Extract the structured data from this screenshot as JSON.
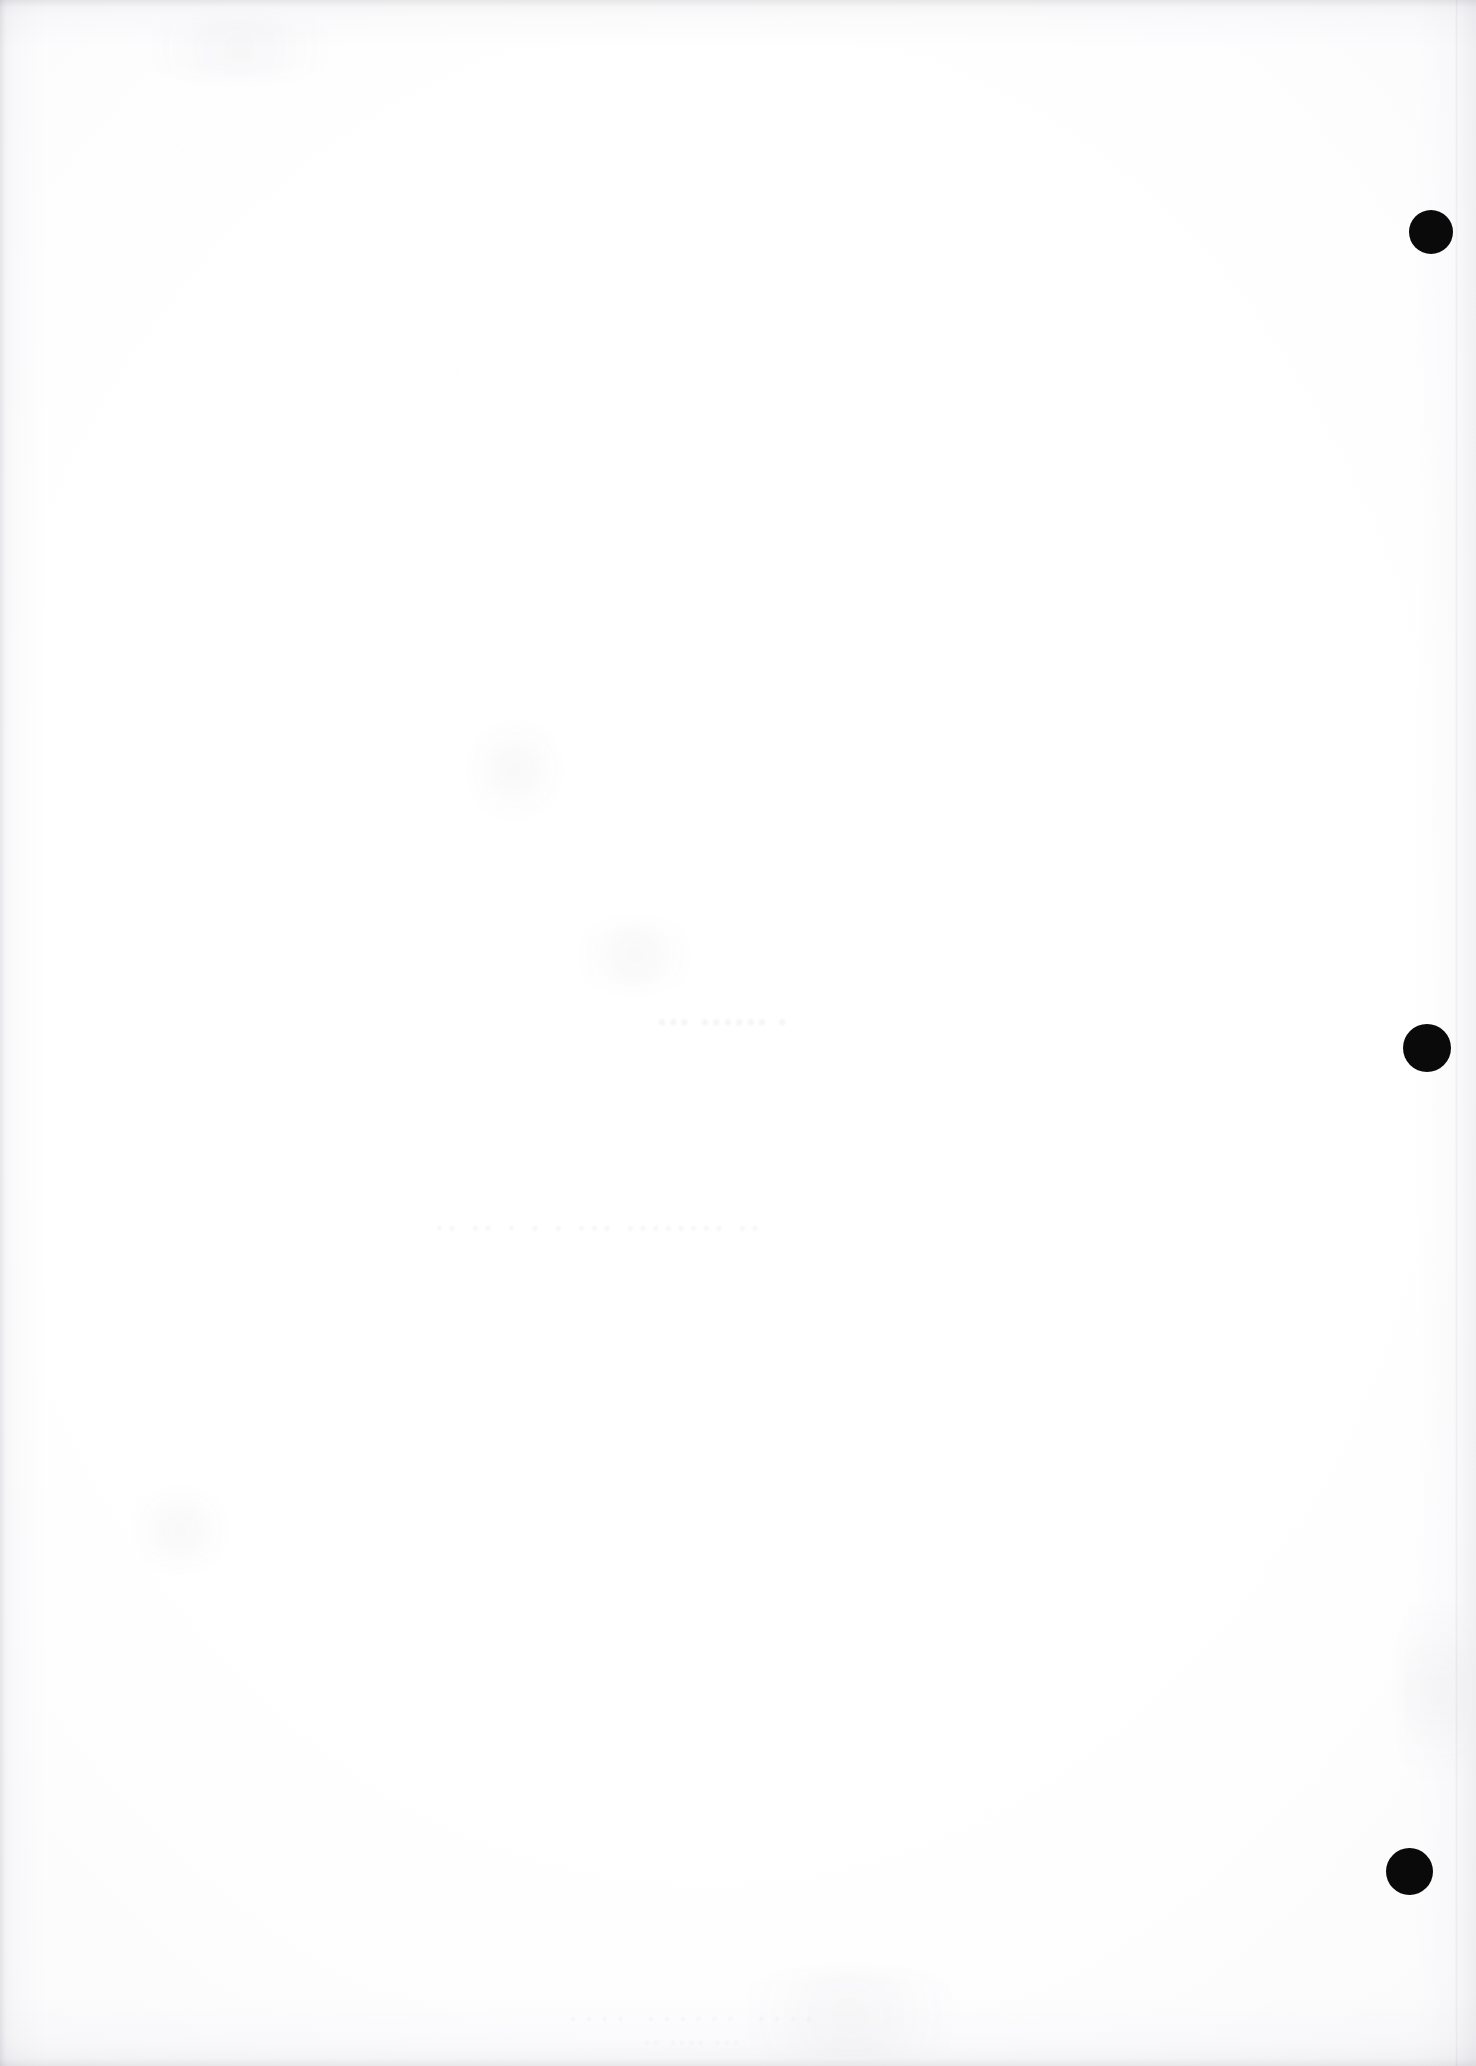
{
  "page": {
    "width": 1476,
    "height": 2066,
    "background_color": "#ffffff",
    "paper_tone": "#fbfbfc",
    "edge_shadow_color": "#f2f2f4",
    "content_summary": "Blank scanned book page with three solid black circular registration marks down the right margin and faint show-through from the reverse side.",
    "visible_text": ""
  },
  "marks": {
    "label": "black circular registration marks",
    "color": "#0a0a0a",
    "count": 3,
    "items": [
      {
        "id": "mark-1",
        "name": "punch-mark-top",
        "cx": 1431,
        "cy": 232,
        "diameter": 44
      },
      {
        "id": "mark-2",
        "name": "punch-mark-middle",
        "cx": 1427,
        "cy": 1048,
        "diameter": 48
      },
      {
        "id": "mark-3",
        "name": "punch-mark-bottom",
        "cx": 1409,
        "cy": 1871,
        "diameter": 47
      }
    ]
  },
  "showthrough": {
    "label": "faint reverse-side bleed (illegible)",
    "color": "#46465540",
    "lines": [
      {
        "id": "st-1",
        "text": "• •••••• •••",
        "x": 655,
        "y": 1008,
        "variant": "st1"
      },
      {
        "id": "st-2",
        "text": "•• ••••••••  •••   •   •   • •• ••",
        "x": 430,
        "y": 1218,
        "variant": "st2"
      },
      {
        "id": "st-3",
        "text": "••••  ••••••  ••••",
        "x": 560,
        "y": 2010,
        "variant": "st3"
      },
      {
        "id": "st-4",
        "text": "•••  ••••  ••",
        "x": 640,
        "y": 2035,
        "variant": "st4"
      }
    ]
  },
  "smudges": {
    "label": "faint paper smudges",
    "items": [
      {
        "id": "sm-1",
        "x": 470,
        "y": 710,
        "w": 90,
        "h": 120
      },
      {
        "id": "sm-2",
        "x": 560,
        "y": 920,
        "w": 150,
        "h": 70
      },
      {
        "id": "sm-3",
        "x": 110,
        "y": 18,
        "w": 260,
        "h": 60
      },
      {
        "id": "sm-4",
        "x": 700,
        "y": 1970,
        "w": 300,
        "h": 90
      },
      {
        "id": "sm-5",
        "x": 1400,
        "y": 1560,
        "w": 70,
        "h": 260
      },
      {
        "id": "sm-6",
        "x": 120,
        "y": 1490,
        "w": 120,
        "h": 80
      }
    ]
  }
}
